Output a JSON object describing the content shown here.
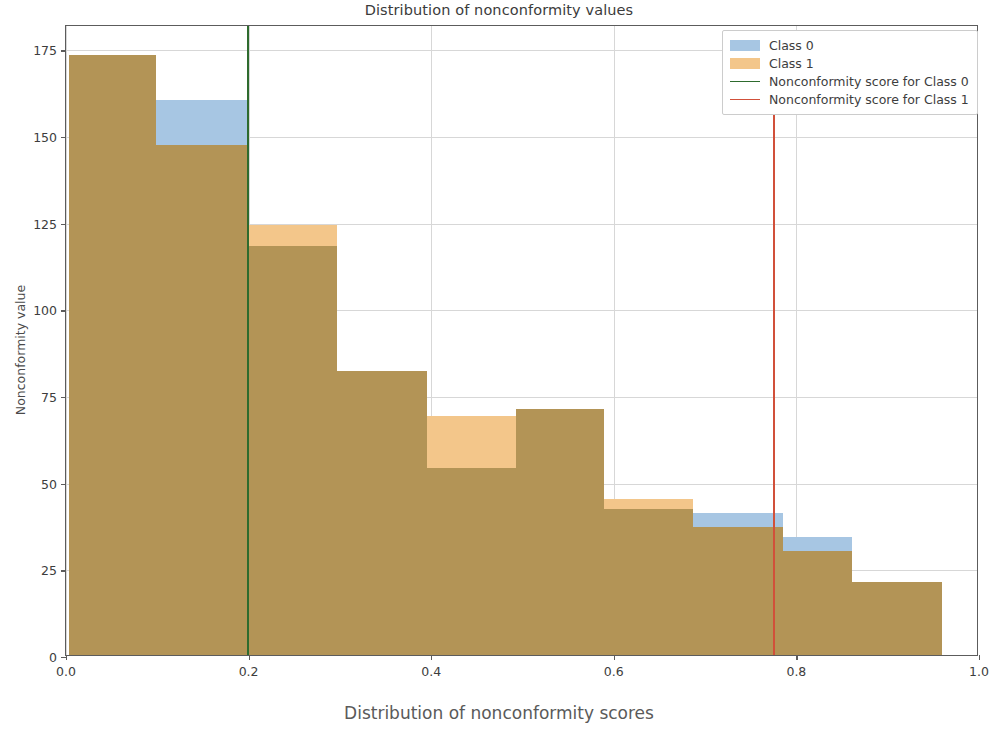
{
  "chart_data": {
    "type": "bar",
    "title": "Distribution of nonconformity values",
    "xlabel": "Distribution of nonconformity scores",
    "ylabel": "Nonconformity value",
    "xlim": [
      0.0,
      1.0
    ],
    "ylim": [
      0,
      182
    ],
    "grid": true,
    "legend_position": "upper right",
    "xticks": [
      0.0,
      0.2,
      0.4,
      0.6,
      0.8,
      1.0
    ],
    "xtick_labels": [
      "0.0",
      "0.2",
      "0.4",
      "0.6",
      "0.8",
      "1.0"
    ],
    "yticks": [
      0,
      25,
      50,
      75,
      100,
      125,
      150,
      175
    ],
    "ytick_labels": [
      "0",
      "25",
      "50",
      "75",
      "100",
      "125",
      "150",
      "175"
    ],
    "bin_edges": [
      0.003,
      0.099,
      0.199,
      0.297,
      0.395,
      0.493,
      0.589,
      0.687,
      0.785,
      0.861,
      0.96
    ],
    "series": [
      {
        "name": "Class 0",
        "color": "#a7c6e3",
        "values": [
          173,
          160,
          118,
          82,
          54,
          71,
          42,
          41,
          34,
          21
        ]
      },
      {
        "name": "Class 1",
        "color": "#f3c68a",
        "values": [
          173,
          147,
          124,
          82,
          69,
          71,
          45,
          37,
          30,
          21
        ]
      }
    ],
    "overlap_color": "#b39456",
    "vlines": [
      {
        "name": "Nonconformity score for Class 0",
        "value": 0.199,
        "color": "#2e6b2e",
        "y_top": 182,
        "y_bottom": 0
      },
      {
        "name": "Nonconformity score for Class 1",
        "value": 0.775,
        "color": "#d1503a",
        "y_top": 157,
        "y_bottom": 0
      }
    ],
    "legend_entries": [
      {
        "label": "Class 0",
        "type": "patch",
        "color": "#a7c6e3"
      },
      {
        "label": "Class 1",
        "type": "patch",
        "color": "#f3c68a"
      },
      {
        "label": "Nonconformity score for Class 0",
        "type": "line",
        "color": "#2e6b2e"
      },
      {
        "label": "Nonconformity score for Class 1",
        "type": "line",
        "color": "#d1503a"
      }
    ]
  }
}
